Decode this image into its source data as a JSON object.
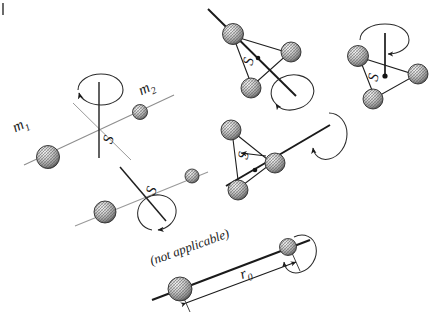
{
  "figure": {
    "domain": "diagram",
    "background_color": "#ffffff",
    "ink_color": "#1a1a1a",
    "axis_light_color": "#8c8c8c",
    "sphere_fill": "#d9d9d9",
    "sphere_shade": "#4d4d4d"
  },
  "labels": {
    "m1": "m",
    "m1_sub": "1",
    "m2": "m",
    "m2_sub": "2",
    "s_axis_top_left": "S",
    "s_axis_mid_left": "S",
    "s_triangle_top": "S",
    "s_triangle_right": "S",
    "s_triangle_mid": "S",
    "not_applicable": "(not applicable)",
    "r0": "r",
    "r0_sub": "0"
  },
  "configurations": [
    {
      "id": "two-mass-perpendicular-axis",
      "name": "two masses, axis perpendicular to line of centers through S",
      "masses": 2,
      "mass_labels": [
        "m1",
        "m2"
      ],
      "center_label": "S",
      "rotation": "about vertical axis through S"
    },
    {
      "id": "two-mass-oblique-axis",
      "name": "two masses, axis oblique through S",
      "masses": 2,
      "center_label": "S",
      "rotation": "about oblique axis through S"
    },
    {
      "id": "triangle-top-oblique-axis",
      "name": "three masses in triangle, axis through one vertex and S",
      "masses": 3,
      "center_label": "S",
      "rotation": "about oblique axis"
    },
    {
      "id": "triangle-right-vertical-axis",
      "name": "three masses in triangle, vertical axis through S",
      "masses": 3,
      "center_label": "S",
      "rotation": "about vertical axis through S"
    },
    {
      "id": "triangle-mid-long-axis",
      "name": "three masses in triangle, long axis in plane through S",
      "masses": 3,
      "center_label": "S",
      "rotation": "about in-plane axis"
    },
    {
      "id": "dumbbell-axis-along-line",
      "name": "two masses, axis along line of centers (not applicable)",
      "masses": 2,
      "annotation": "(not applicable)",
      "dimension_label": "r0",
      "rotation": "about the line joining the masses"
    }
  ]
}
